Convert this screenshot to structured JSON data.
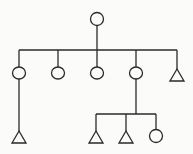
{
  "diagram": {
    "type": "kinship-tree",
    "legend_implied": {
      "circle": "female",
      "triangle": "male"
    },
    "nodes": [
      {
        "id": "root",
        "shape": "circle",
        "x": 97,
        "y": 19
      },
      {
        "id": "c1",
        "shape": "circle",
        "x": 19,
        "y": 73
      },
      {
        "id": "c2",
        "shape": "circle",
        "x": 58,
        "y": 73
      },
      {
        "id": "c3",
        "shape": "circle",
        "x": 97,
        "y": 73
      },
      {
        "id": "c4",
        "shape": "circle",
        "x": 136,
        "y": 73
      },
      {
        "id": "c5",
        "shape": "triangle",
        "x": 177,
        "y": 75
      },
      {
        "id": "g1",
        "shape": "triangle",
        "x": 19,
        "y": 137
      },
      {
        "id": "g2",
        "shape": "triangle",
        "x": 96,
        "y": 137
      },
      {
        "id": "g3",
        "shape": "triangle",
        "x": 126,
        "y": 137
      },
      {
        "id": "g4",
        "shape": "circle",
        "x": 156,
        "y": 136
      }
    ],
    "edges": [
      [
        "root",
        "c1"
      ],
      [
        "root",
        "c2"
      ],
      [
        "root",
        "c3"
      ],
      [
        "root",
        "c4"
      ],
      [
        "root",
        "c5"
      ],
      [
        "c1",
        "g1"
      ],
      [
        "c4",
        "g2"
      ],
      [
        "c4",
        "g3"
      ],
      [
        "c4",
        "g4"
      ]
    ]
  }
}
